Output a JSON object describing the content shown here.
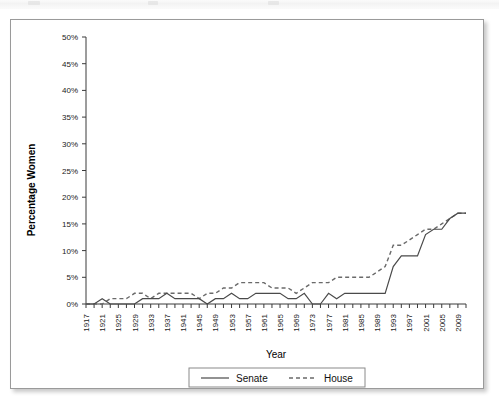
{
  "figure": {
    "y_axis_title": "Percentage Women",
    "x_axis_title": "Year"
  },
  "legend": {
    "senate_label": "Senate",
    "house_label": "House"
  },
  "chart_data": {
    "type": "line",
    "title": "",
    "xlabel": "Year",
    "ylabel": "Percentage Women",
    "xlim": [
      1917,
      2011
    ],
    "ylim": [
      0,
      50
    ],
    "ytick_labels": [
      "0%",
      "5%",
      "10%",
      "15%",
      "20%",
      "25%",
      "30%",
      "35%",
      "40%",
      "45%",
      "50%"
    ],
    "ytick_values": [
      0,
      5,
      10,
      15,
      20,
      25,
      30,
      35,
      40,
      45,
      50
    ],
    "xtick_labels": [
      "1917",
      "1921",
      "1925",
      "1929",
      "1933",
      "1937",
      "1941",
      "1945",
      "1949",
      "1953",
      "1957",
      "1961",
      "1965",
      "1969",
      "1973",
      "1977",
      "1981",
      "1985",
      "1989",
      "1993",
      "1997",
      "2001",
      "2005",
      "2009"
    ],
    "x": [
      1917,
      1919,
      1921,
      1923,
      1925,
      1927,
      1929,
      1931,
      1933,
      1935,
      1937,
      1939,
      1941,
      1943,
      1945,
      1947,
      1949,
      1951,
      1953,
      1955,
      1957,
      1959,
      1961,
      1963,
      1965,
      1967,
      1969,
      1971,
      1973,
      1975,
      1977,
      1979,
      1981,
      1983,
      1985,
      1987,
      1989,
      1991,
      1993,
      1995,
      1997,
      1999,
      2001,
      2003,
      2005,
      2007,
      2009,
      2011
    ],
    "grid": false,
    "legend_position": "bottom",
    "series": [
      {
        "name": "Senate",
        "style": "solid",
        "values": [
          0,
          0,
          1,
          0,
          0,
          0,
          0,
          1,
          1,
          1,
          2,
          1,
          1,
          1,
          1,
          0,
          1,
          1,
          2,
          1,
          1,
          2,
          2,
          2,
          2,
          1,
          1,
          2,
          0,
          0,
          2,
          1,
          2,
          2,
          2,
          2,
          2,
          2,
          7,
          9,
          9,
          9,
          13,
          14,
          14,
          16,
          17,
          17
        ]
      },
      {
        "name": "House",
        "style": "dashed",
        "values": [
          0,
          0,
          0,
          1,
          1,
          1,
          2,
          2,
          1,
          2,
          2,
          2,
          2,
          2,
          1,
          2,
          2,
          3,
          3,
          4,
          4,
          4,
          4,
          3,
          3,
          3,
          2,
          3,
          4,
          4,
          4,
          5,
          5,
          5,
          5,
          5,
          6,
          7,
          11,
          11,
          12,
          13,
          14,
          14,
          15,
          16,
          17,
          17
        ]
      }
    ]
  }
}
